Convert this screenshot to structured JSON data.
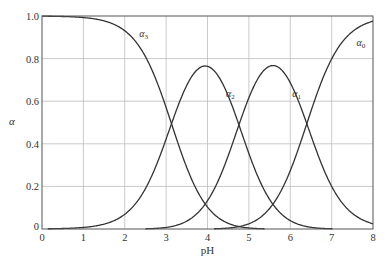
{
  "chart_data": {
    "type": "line",
    "title": "",
    "xlabel": "pH",
    "ylabel": "α",
    "xlim": [
      0,
      8
    ],
    "ylim": [
      0,
      1.0
    ],
    "grid": true,
    "x_ticks": [
      "0",
      "1",
      "2",
      "3",
      "4",
      "5",
      "6",
      "7",
      "8"
    ],
    "y_ticks": [
      "0",
      "0.2",
      "0.4",
      "0.6",
      "0.8",
      "1.0"
    ],
    "pKa": [
      3.13,
      4.76,
      6.4
    ],
    "series": [
      {
        "name": "α3",
        "label_base": "α",
        "label_sub": "3",
        "peak": {
          "x": 0,
          "y": 1.0
        },
        "points": [
          [
            0,
            1.0
          ],
          [
            1,
            0.99
          ],
          [
            2,
            0.93
          ],
          [
            3,
            0.57
          ],
          [
            3.13,
            0.5
          ],
          [
            4,
            0.12
          ],
          [
            5,
            0.01
          ],
          [
            6,
            0.0
          ],
          [
            8,
            0.0
          ]
        ]
      },
      {
        "name": "α2",
        "label_base": "α",
        "label_sub": "2",
        "peak": {
          "x": 3.95,
          "y": 0.76
        },
        "points": [
          [
            0.5,
            0.0
          ],
          [
            1,
            0.01
          ],
          [
            2,
            0.07
          ],
          [
            3,
            0.42
          ],
          [
            3.13,
            0.48
          ],
          [
            4,
            0.76
          ],
          [
            4.76,
            0.48
          ],
          [
            5,
            0.34
          ],
          [
            6,
            0.05
          ],
          [
            6.5,
            0.01
          ]
        ]
      },
      {
        "name": "α1",
        "label_base": "α",
        "label_sub": "1",
        "peak": {
          "x": 5.58,
          "y": 0.76
        },
        "points": [
          [
            2.7,
            0.0
          ],
          [
            3,
            0.01
          ],
          [
            4,
            0.11
          ],
          [
            4.76,
            0.48
          ],
          [
            5,
            0.61
          ],
          [
            5.6,
            0.76
          ],
          [
            6,
            0.7
          ],
          [
            6.4,
            0.5
          ],
          [
            7,
            0.2
          ],
          [
            8,
            0.02
          ]
        ]
      },
      {
        "name": "α0",
        "label_base": "α",
        "label_sub": "0",
        "peak": {
          "x": 8,
          "y": 0.98
        },
        "points": [
          [
            4.5,
            0.0
          ],
          [
            5,
            0.02
          ],
          [
            6,
            0.27
          ],
          [
            6.4,
            0.5
          ],
          [
            7,
            0.8
          ],
          [
            8,
            0.97
          ]
        ]
      }
    ]
  }
}
